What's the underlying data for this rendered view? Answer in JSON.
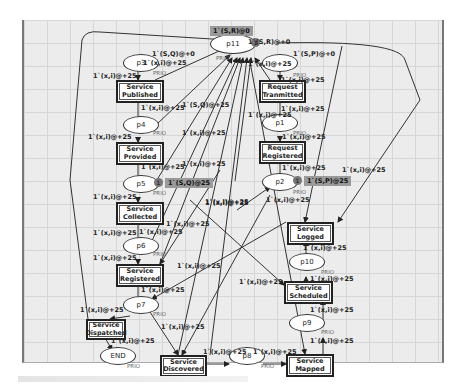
{
  "diagram": {
    "type": "colored-petri-net",
    "places": [
      {
        "id": "p11",
        "label": "p11",
        "x": 232,
        "y": 43,
        "w": 44,
        "h": 18,
        "marking": "1`(S,R)@0",
        "tokens": "1"
      },
      {
        "id": "p3",
        "label": "p3",
        "x": 140,
        "y": 62,
        "w": 34,
        "h": 16
      },
      {
        "id": "p4",
        "label": "p4",
        "x": 140,
        "y": 124,
        "w": 34,
        "h": 16
      },
      {
        "id": "p5",
        "label": "p5",
        "x": 140,
        "y": 183,
        "w": 34,
        "h": 16,
        "marking": "1`(S,Q)@25",
        "tokens": "1"
      },
      {
        "id": "p6",
        "label": "p6",
        "x": 140,
        "y": 245,
        "w": 34,
        "h": 16
      },
      {
        "id": "p7",
        "label": "p7",
        "x": 140,
        "y": 304,
        "w": 34,
        "h": 16
      },
      {
        "id": "end",
        "label": "END",
        "x": 117,
        "y": 355,
        "w": 34,
        "h": 16
      },
      {
        "id": "p8",
        "label": "p8",
        "x": 246,
        "y": 355,
        "w": 34,
        "h": 16
      },
      {
        "id": "p9",
        "label": "p9",
        "x": 306,
        "y": 322,
        "w": 34,
        "h": 16
      },
      {
        "id": "p10",
        "label": "p10",
        "x": 306,
        "y": 261,
        "w": 34,
        "h": 16
      },
      {
        "id": "p2",
        "label": "p2",
        "x": 279,
        "y": 181,
        "w": 34,
        "h": 16,
        "marking": "1`(S,P)@25",
        "tokens": "1"
      },
      {
        "id": "p1",
        "label": "p1",
        "x": 279,
        "y": 122,
        "w": 34,
        "h": 16
      },
      {
        "id": "p_req",
        "label": "",
        "x": 279,
        "y": 62,
        "w": 34,
        "h": 16
      }
    ],
    "transitions": [
      {
        "id": "t_published",
        "label": "Service\nPublished",
        "x": 116,
        "y": 80,
        "w": 44,
        "h": 19
      },
      {
        "id": "t_provided",
        "label": "Service\nProvided",
        "x": 116,
        "y": 142,
        "w": 44,
        "h": 19
      },
      {
        "id": "t_collected",
        "label": "Service\nCollected",
        "x": 116,
        "y": 202,
        "w": 44,
        "h": 19
      },
      {
        "id": "t_registered",
        "label": "Service\nRegistered",
        "x": 116,
        "y": 264,
        "w": 44,
        "h": 19
      },
      {
        "id": "t_dispatched",
        "label": "Service\nDispatched",
        "x": 86,
        "y": 319,
        "w": 36,
        "h": 17
      },
      {
        "id": "t_discovered",
        "label": "Service\nDiscovered",
        "x": 160,
        "y": 355,
        "w": 43,
        "h": 18
      },
      {
        "id": "t_mapped",
        "label": "Service\nMapped",
        "x": 286,
        "y": 354,
        "w": 44,
        "h": 19
      },
      {
        "id": "t_scheduled",
        "label": "Service\nScheduled",
        "x": 284,
        "y": 281,
        "w": 45,
        "h": 19
      },
      {
        "id": "t_logged",
        "label": "Service\nLogged",
        "x": 287,
        "y": 222,
        "w": 43,
        "h": 19
      },
      {
        "id": "t_registered_req",
        "label": "Request\nRegistered",
        "x": 259,
        "y": 141,
        "w": 43,
        "h": 19
      },
      {
        "id": "t_transmitted",
        "label": "Request\nTranmitted",
        "x": 259,
        "y": 80,
        "w": 43,
        "h": 19
      }
    ],
    "arc_labels": [
      {
        "text": "1`(S,Q)@+0",
        "x": 152,
        "y": 50
      },
      {
        "text": "1`(x,i)@+25",
        "x": 143,
        "y": 59
      },
      {
        "text": "1`(x,i)@+25",
        "x": 93,
        "y": 72
      },
      {
        "text": "1`(x,i)@+25",
        "x": 141,
        "y": 104
      },
      {
        "text": "1`(S,R)@+0",
        "x": 248,
        "y": 38
      },
      {
        "text": "1`(S,P)@+0",
        "x": 293,
        "y": 50
      },
      {
        "text": "1`(x,i)@+25",
        "x": 248,
        "y": 60
      },
      {
        "text": "1`(x,i)@+25",
        "x": 281,
        "y": 76
      },
      {
        "text": "1`(x,i)@+25",
        "x": 281,
        "y": 105
      },
      {
        "text": "1`(x,i)@+25",
        "x": 248,
        "y": 111
      },
      {
        "text": "1`(S,Q)@+25",
        "x": 182,
        "y": 101
      },
      {
        "text": "1`(x,i)@+25",
        "x": 88,
        "y": 133
      },
      {
        "text": "1`(x,i)@+25",
        "x": 182,
        "y": 129
      },
      {
        "text": "1`(x,i)@+25",
        "x": 141,
        "y": 163
      },
      {
        "text": "1`(x,i)@+25",
        "x": 182,
        "y": 160
      },
      {
        "text": "1`(x,i)@+25",
        "x": 282,
        "y": 133
      },
      {
        "text": "1`(x,i)@+25",
        "x": 282,
        "y": 164
      },
      {
        "text": "1`(x,i)@+25",
        "x": 342,
        "y": 166
      },
      {
        "text": "1`(x,i)@+25",
        "x": 205,
        "y": 198
      },
      {
        "text": "1`(x,i)@+25",
        "x": 93,
        "y": 193
      },
      {
        "text": "1`(x,i)@+25",
        "x": 166,
        "y": 220
      },
      {
        "text": "1`(x,i)@+25",
        "x": 205,
        "y": 199
      },
      {
        "text": "1`(x,i)@+25",
        "x": 266,
        "y": 196
      },
      {
        "text": "1`(x,i)@+25",
        "x": 93,
        "y": 229
      },
      {
        "text": "1`(x,i)@+25",
        "x": 139,
        "y": 228
      },
      {
        "text": "1`(x,i)@+25",
        "x": 93,
        "y": 254
      },
      {
        "text": "1`(x,i)@+25",
        "x": 177,
        "y": 262
      },
      {
        "text": "1`(x,i)@+25",
        "x": 239,
        "y": 278
      },
      {
        "text": "1`(x,i)@+25",
        "x": 141,
        "y": 286
      },
      {
        "text": "1`(x,i)@+25",
        "x": 80,
        "y": 306
      },
      {
        "text": "1`(x,i)@+25",
        "x": 161,
        "y": 323
      },
      {
        "text": "1`(x,i)@+25",
        "x": 111,
        "y": 337
      },
      {
        "text": "1`(x,i)@+25",
        "x": 303,
        "y": 244
      },
      {
        "text": "1`(x,i)@+25",
        "x": 310,
        "y": 275
      },
      {
        "text": "1`(x,i)@+25",
        "x": 310,
        "y": 306
      },
      {
        "text": "1`(x,i)@+25",
        "x": 310,
        "y": 337
      },
      {
        "text": "1`(x,i)@+25",
        "x": 203,
        "y": 348
      },
      {
        "text": "1`(x,i)@+25",
        "x": 253,
        "y": 348
      }
    ],
    "priority_labels": [
      {
        "text": "PRIO",
        "x": 153,
        "y": 70
      },
      {
        "text": "PRIO",
        "x": 216,
        "y": 55
      },
      {
        "text": "PRIO",
        "x": 293,
        "y": 72
      },
      {
        "text": "PRIO",
        "x": 293,
        "y": 130
      },
      {
        "text": "PRIO",
        "x": 153,
        "y": 130
      },
      {
        "text": "PRIO",
        "x": 153,
        "y": 190
      },
      {
        "text": "PRIO",
        "x": 293,
        "y": 189
      },
      {
        "text": "PRIO",
        "x": 153,
        "y": 251
      },
      {
        "text": "PRIO",
        "x": 153,
        "y": 311
      },
      {
        "text": "PRIO",
        "x": 127,
        "y": 363
      },
      {
        "text": "PRIO",
        "x": 261,
        "y": 363
      },
      {
        "text": "PRIO",
        "x": 321,
        "y": 329
      },
      {
        "text": "PRIO",
        "x": 321,
        "y": 269
      }
    ]
  }
}
